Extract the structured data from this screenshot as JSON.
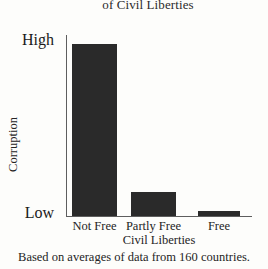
{
  "chart_data": {
    "type": "bar",
    "title": "of Civil Liberties",
    "title_note": "top line of title is cropped off the image",
    "categories": [
      "Not Free",
      "Partly Free",
      "Free"
    ],
    "values": [
      95,
      13,
      3
    ],
    "xlabel": "Civil Liberties",
    "ylabel": "Corruption",
    "ytick_labels": [
      "High",
      "Low"
    ],
    "ylim": [
      0,
      100
    ],
    "grid": false,
    "legend": false,
    "bar_color": "#2a2a2a",
    "axis_color": "#5e5e5e",
    "background": "#fdfdfb",
    "footnote": "Based on averages of data from 160 countries."
  },
  "figure": {
    "title": "of Civil Liberties",
    "y_axis": {
      "label": "Corruption",
      "high_label": "High",
      "low_label": "Low"
    },
    "x_axis": {
      "label": "Civil Liberties",
      "ticks": [
        "Not Free",
        "Partly Free",
        "Free"
      ]
    },
    "footnote": "Based on averages of data from 160 countries."
  }
}
